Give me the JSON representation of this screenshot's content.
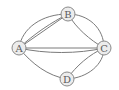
{
  "diagram": {
    "type": "multigraph",
    "nodes": [
      {
        "id": "A",
        "label": "A",
        "x": 19,
        "y": 48
      },
      {
        "id": "B",
        "label": "B",
        "x": 68,
        "y": 14
      },
      {
        "id": "C",
        "label": "C",
        "x": 104,
        "y": 48
      },
      {
        "id": "D",
        "label": "D",
        "x": 67,
        "y": 79
      }
    ],
    "edges": [
      {
        "from": "A",
        "to": "B",
        "count": 3
      },
      {
        "from": "A",
        "to": "C",
        "count": 2
      },
      {
        "from": "A",
        "to": "D",
        "count": 1
      },
      {
        "from": "B",
        "to": "C",
        "count": 2
      },
      {
        "from": "C",
        "to": "D",
        "count": 2
      }
    ],
    "colors": {
      "edge": "#7a7a7a",
      "node_fill": "#ececec",
      "node_stroke": "#8a8a8a",
      "label": "#5a5a5a"
    }
  }
}
